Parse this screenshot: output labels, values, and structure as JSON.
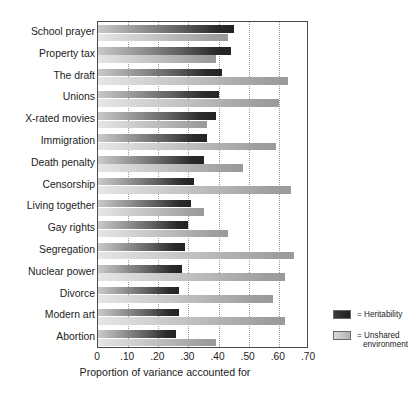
{
  "chart_data": {
    "type": "bar",
    "orientation": "horizontal",
    "title": "",
    "xlabel": "Proportion of variance accounted for",
    "ylabel": "",
    "xlim": [
      0,
      0.7
    ],
    "xticks": [
      "0",
      ".10",
      ".20",
      ".30",
      ".40",
      ".50",
      ".60",
      ".70"
    ],
    "xtick_values": [
      0,
      0.1,
      0.2,
      0.3,
      0.4,
      0.5,
      0.6,
      0.7
    ],
    "grid": "vertical-dotted",
    "legend_position": "right",
    "categories": [
      "School prayer",
      "Property tax",
      "The draft",
      "Unions",
      "X-rated movies",
      "Immigration",
      "Death penalty",
      "Censorship",
      "Living together",
      "Gay rights",
      "Segregation",
      "Nuclear power",
      "Divorce",
      "Modern art",
      "Abortion"
    ],
    "series": [
      {
        "name": "Heritability",
        "color": "#262626",
        "values": [
          0.45,
          0.44,
          0.41,
          0.4,
          0.39,
          0.36,
          0.35,
          0.32,
          0.31,
          0.3,
          0.29,
          0.28,
          0.27,
          0.27,
          0.26
        ]
      },
      {
        "name": "Unshared environment",
        "color": "#b0b0b0",
        "values": [
          0.43,
          0.39,
          0.63,
          0.6,
          0.36,
          0.59,
          0.48,
          0.64,
          0.35,
          0.43,
          0.65,
          0.62,
          0.58,
          0.62,
          0.39
        ]
      }
    ]
  },
  "legend": {
    "entries": [
      {
        "marker": "=",
        "label": "Heritability",
        "label2": ""
      },
      {
        "marker": "=",
        "label": "Unshared",
        "label2": "environment"
      }
    ]
  },
  "axis": {
    "x_title": "Proportion of variance accounted for"
  }
}
